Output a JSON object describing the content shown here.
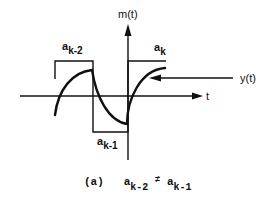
{
  "diagram": {
    "y_axis_label": "m(t)",
    "x_axis_label": "t",
    "signal_label": "y(t)",
    "levels": [
      {
        "base": "a",
        "sub": "k-2"
      },
      {
        "base": "a",
        "sub": "k-1"
      },
      {
        "base": "a",
        "sub": "k"
      }
    ],
    "caption": {
      "tag": "(a)",
      "lhs_base": "a",
      "lhs_sub": "k-2",
      "relation": "≠",
      "rhs_base": "a",
      "rhs_sub": "k-1"
    },
    "colors": {
      "stroke": "#111111",
      "background": "#ffffff"
    }
  }
}
